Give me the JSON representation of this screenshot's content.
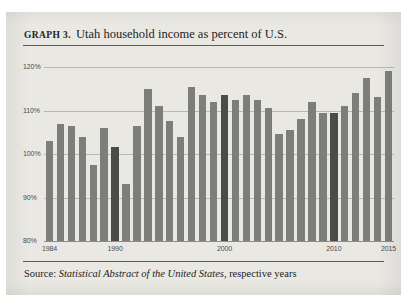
{
  "figure": {
    "label": "GRAPH 3.",
    "title": "Utah household income as percent of U.S.",
    "source_prefix": "Source:",
    "source_italic": "Statistical Abstract of the United States",
    "source_suffix": ", respective years",
    "background_color": "#e9e8e3",
    "rule_color": "#5b5b5b"
  },
  "chart_data": {
    "type": "bar",
    "title": "Utah household income as percent of U.S.",
    "xlabel": "",
    "ylabel": "",
    "ylim": [
      80,
      120
    ],
    "yticks": [
      "80%",
      "90%",
      "100%",
      "110%",
      "120%"
    ],
    "ytick_values": [
      80,
      90,
      100,
      110,
      120
    ],
    "grid": true,
    "legend": "none",
    "bar_color": "#7d7d7b",
    "highlight_color": "#4b4b4a",
    "highlight_years": [
      1990,
      2000,
      2010
    ],
    "xtick_labels": [
      "1984",
      "1990",
      "2000",
      "2010",
      "2015"
    ],
    "categories": [
      "1984",
      "1985",
      "1986",
      "1987",
      "1988",
      "1989",
      "1990",
      "1991",
      "1992",
      "1993",
      "1994",
      "1995",
      "1996",
      "1997",
      "1998",
      "1999",
      "2000",
      "2001",
      "2002",
      "2003",
      "2004",
      "2005",
      "2006",
      "2007",
      "2008",
      "2009",
      "2010",
      "2011",
      "2012",
      "2013",
      "2014",
      "2015"
    ],
    "values": [
      103.0,
      107.0,
      106.5,
      104.0,
      97.5,
      106.0,
      101.5,
      93.0,
      106.5,
      115.0,
      111.0,
      107.5,
      104.0,
      115.5,
      113.5,
      112.0,
      113.5,
      112.5,
      113.5,
      112.5,
      110.5,
      104.5,
      105.5,
      108.0,
      112.0,
      109.5,
      109.5,
      111.0,
      114.0,
      117.5,
      113.0,
      119.0
    ]
  }
}
